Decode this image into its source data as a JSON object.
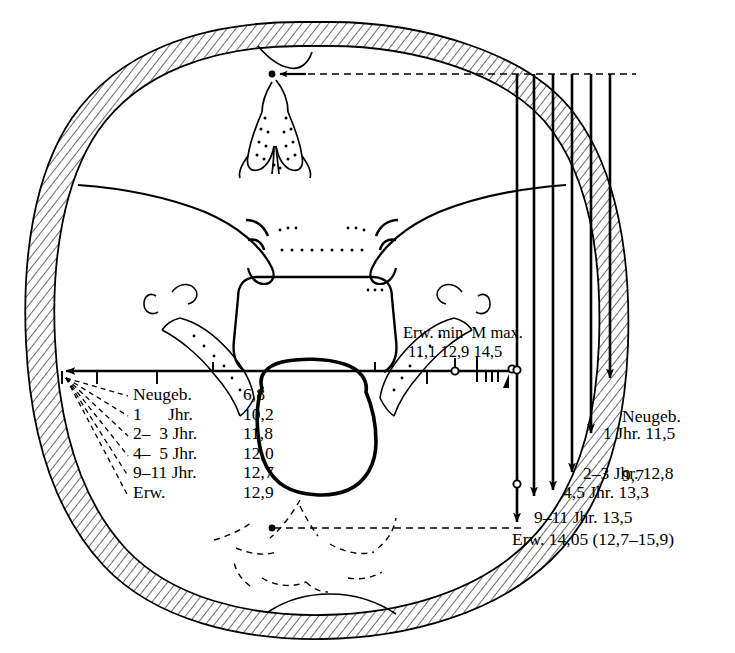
{
  "figure": {
    "ink_color": "#000000",
    "background": "#ffffff"
  },
  "scale_header": {
    "labels": "Erw. min  M max.",
    "values": "11,1 12,9 14,5",
    "min_label": "Erw. min",
    "mean_label": "M",
    "max_label": "max.",
    "min_value": "11,1",
    "mean_value": "12,9",
    "max_value": "14,5"
  },
  "transverse_table": {
    "rows": [
      {
        "name": "Neugeb.",
        "value": "6,8"
      },
      {
        "name": "1      Jhr.",
        "value": "10,2"
      },
      {
        "name": "2–  3 Jhr.",
        "value": "11,8"
      },
      {
        "name": "4–  5 Jhr.",
        "value": "12,0"
      },
      {
        "name": "9–11 Jhr.",
        "value": "12,7"
      },
      {
        "name": "Erw.",
        "value": "12,9"
      }
    ]
  },
  "sagittal_labels": [
    {
      "line1": "Neugeb.",
      "line2": "9,7"
    },
    {
      "line1": "1 Jhr. 11,5",
      "line2": ""
    },
    {
      "line1": "2–3 Jhr. 12,8",
      "line2": ""
    },
    {
      "line1": "4,5 Jhr. 13,3",
      "line2": ""
    },
    {
      "line1": "9–11 Jhr. 13,5",
      "line2": ""
    },
    {
      "line1": "Erw. 14,05 (12,7–15,9)",
      "line2": ""
    }
  ],
  "icons": {
    "left_arrow": "arrow-left-icon",
    "down_arrow": "arrow-down-icon",
    "circle_marker": "circle-marker-icon",
    "dashed_leader": "dashed-leader-icon"
  }
}
